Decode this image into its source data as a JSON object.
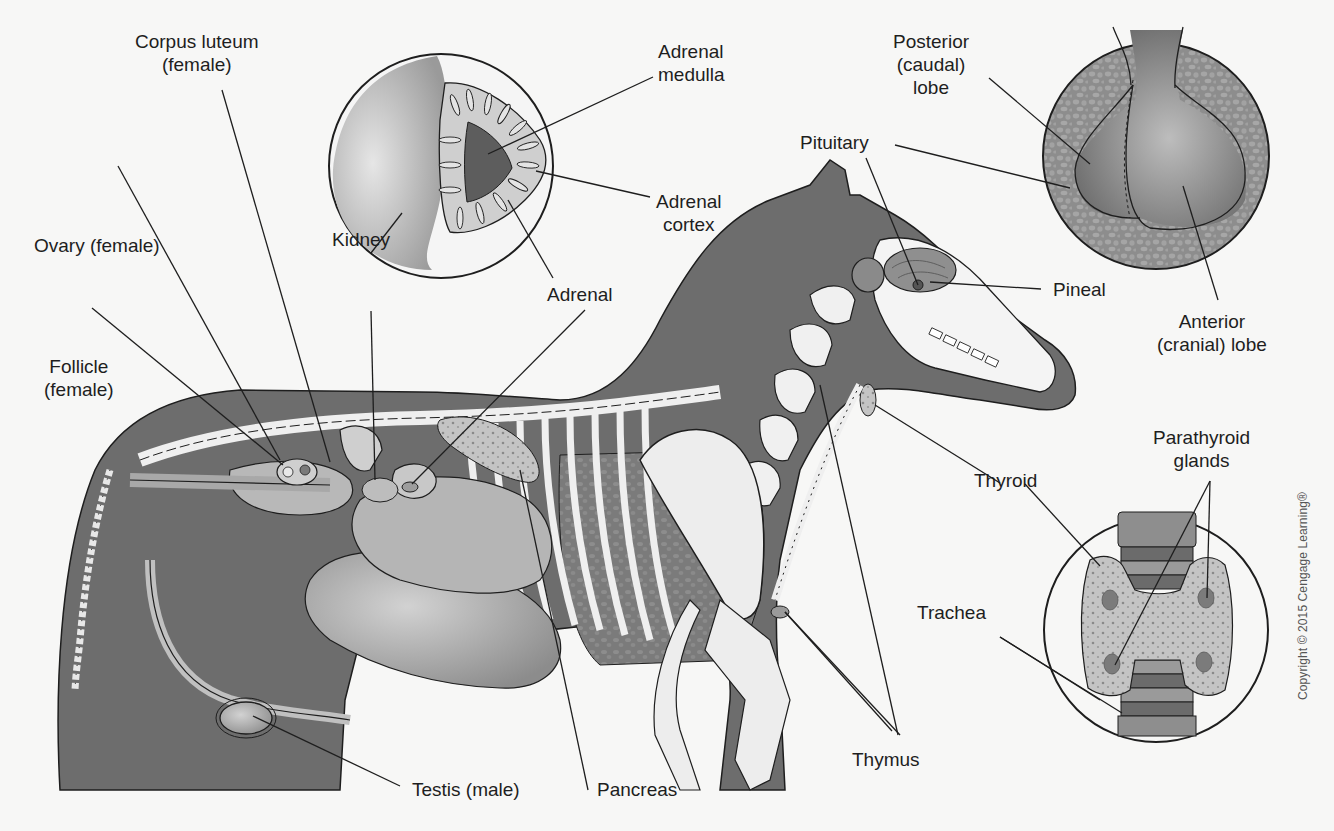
{
  "figure": {
    "colors": {
      "background": "#f7f7f6",
      "body_fill": "#6f6f6f",
      "body_dark": "#5a5a5a",
      "bone": "#f1f1f1",
      "organ": "#a6a6a6",
      "organ_light": "#c7c7c7",
      "tissue": "#8e8e8e",
      "outline": "#1e1e1e",
      "leader_line": "#1e1e1e"
    },
    "labels": {
      "adrenal_medulla": [
        "Adrenal",
        "medulla"
      ],
      "adrenal_cortex": [
        "Adrenal",
        "cortex"
      ],
      "corpus_luteum": [
        "Corpus luteum",
        "(female)"
      ],
      "ovary": [
        "Ovary (female)"
      ],
      "follicle": [
        "Follicle",
        "(female)"
      ],
      "kidney": [
        "Kidney"
      ],
      "adrenal": [
        "Adrenal"
      ],
      "posterior_lobe": [
        "Posterior",
        "(caudal)",
        "lobe"
      ],
      "pituitary": [
        "Pituitary"
      ],
      "pineal": [
        "Pineal"
      ],
      "anterior_lobe": [
        "Anterior",
        "(cranial) lobe"
      ],
      "parathyroid": [
        "Parathyroid",
        "glands"
      ],
      "thyroid": [
        "Thyroid"
      ],
      "trachea": [
        "Trachea"
      ],
      "thymus": [
        "Thymus"
      ],
      "testis": [
        "Testis (male)"
      ],
      "pancreas": [
        "Pancreas"
      ]
    },
    "insets": [
      {
        "name": "adrenal-kidney-inset",
        "shows": [
          "Kidney",
          "Adrenal cortex",
          "Adrenal medulla"
        ]
      },
      {
        "name": "pituitary-inset",
        "shows": [
          "Posterior (caudal) lobe",
          "Anterior (cranial) lobe"
        ]
      },
      {
        "name": "thyroid-inset",
        "shows": [
          "Thyroid",
          "Parathyroid glands",
          "Trachea"
        ]
      }
    ],
    "copyright": "Copyright © 2015 Cengage Learning®"
  }
}
